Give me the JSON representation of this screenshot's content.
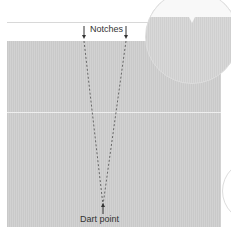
{
  "diagram": {
    "labels": {
      "notches": "Notches",
      "dart_point": "Dart point"
    },
    "colors": {
      "fabric": "#cccccc",
      "line": "#555555",
      "background": "#ffffff"
    }
  }
}
